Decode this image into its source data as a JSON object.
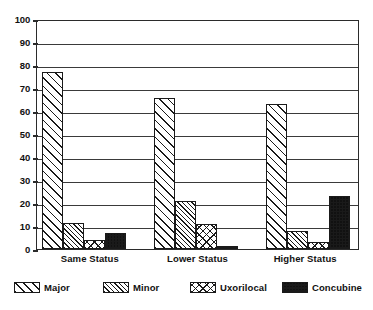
{
  "chart_data": {
    "type": "bar",
    "title": "",
    "subtitle": "",
    "xlabel": "",
    "ylabel": "",
    "categories": [
      "Same Status",
      "Lower Status",
      "Higher Status"
    ],
    "series": [
      {
        "name": "Major",
        "pattern": "diagonal-hatch-wide",
        "values": [
          77,
          65.5,
          63
        ]
      },
      {
        "name": "Minor",
        "pattern": "diagonal-hatch-dense",
        "values": [
          11.5,
          21,
          8
        ]
      },
      {
        "name": "Uxorilocal",
        "pattern": "cross-hatch",
        "values": [
          4,
          11,
          3
        ]
      },
      {
        "name": "Concubine",
        "pattern": "checkerboard-dense",
        "values": [
          7,
          1.5,
          23
        ]
      }
    ],
    "ylim": [
      0,
      100
    ],
    "yticks": [
      0,
      10,
      20,
      30,
      40,
      50,
      60,
      70,
      80,
      90,
      100
    ],
    "ytick_labels": [
      "0",
      "10",
      "20",
      "30",
      "40",
      "50",
      "60",
      "70",
      "80",
      "90",
      "100"
    ],
    "grid": true,
    "grid_axis": "y",
    "legend_position": "bottom",
    "legend_entries": [
      "Major",
      "Minor",
      "Uxorilocal",
      "Concubine"
    ],
    "colors": {
      "ink": "#1a1a1a",
      "grid": "#3a3a3a",
      "axis": "#2b2b2b",
      "background": "#ffffff"
    }
  }
}
